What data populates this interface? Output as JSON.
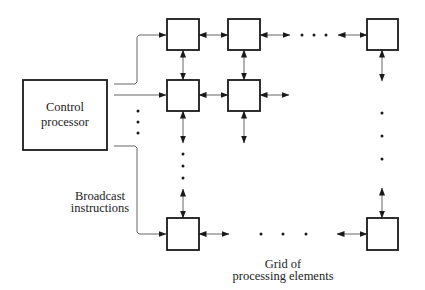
{
  "diagram": {
    "control_processor": {
      "label_line1": "Control",
      "label_line2": "processor",
      "rect": [
        23,
        80,
        84,
        70
      ]
    },
    "broadcast_label": {
      "line1": "Broadcast",
      "line2": "instructions"
    },
    "grid_label": {
      "line1": "Grid of",
      "line2": "processing elements"
    },
    "colors": {
      "stroke": "#1a1a1a",
      "wire": "#555555",
      "text": "#222222",
      "background": "#ffffff"
    },
    "processing_elements": [
      {
        "id": "pe-1-1",
        "x": 167,
        "y": 19,
        "w": 32,
        "h": 31
      },
      {
        "id": "pe-1-2",
        "x": 228,
        "y": 19,
        "w": 32,
        "h": 31
      },
      {
        "id": "pe-1-n",
        "x": 367,
        "y": 19,
        "w": 31,
        "h": 31
      },
      {
        "id": "pe-2-1",
        "x": 167,
        "y": 80,
        "w": 32,
        "h": 31
      },
      {
        "id": "pe-2-2",
        "x": 228,
        "y": 80,
        "w": 32,
        "h": 31
      },
      {
        "id": "pe-m-1",
        "x": 167,
        "y": 218,
        "w": 32,
        "h": 32
      },
      {
        "id": "pe-m-n",
        "x": 367,
        "y": 218,
        "w": 31,
        "h": 32
      }
    ],
    "broadcast_wires": [
      {
        "id": "wire-row1",
        "points": [
          [
            114,
            84
          ],
          [
            135,
            84
          ],
          [
            137,
            82
          ],
          [
            137,
            37
          ],
          [
            139,
            35
          ],
          [
            166,
            35
          ]
        ]
      },
      {
        "id": "wire-row2",
        "points": [
          [
            114,
            95
          ],
          [
            166,
            95
          ]
        ]
      },
      {
        "id": "wire-rowm",
        "points": [
          [
            114,
            146
          ],
          [
            135,
            146
          ],
          [
            137,
            148
          ],
          [
            137,
            232
          ],
          [
            139,
            234
          ],
          [
            166,
            234
          ]
        ]
      }
    ],
    "links": [
      {
        "id": "link-h-1-1-1-2",
        "x1": 199,
        "y1": 35,
        "x2": 228,
        "y2": 35,
        "start": true,
        "end": true
      },
      {
        "id": "link-h-1-2-out",
        "x1": 260,
        "y1": 35,
        "x2": 290,
        "y2": 35,
        "start": true,
        "end": true
      },
      {
        "id": "link-h-1-n-in",
        "x1": 338,
        "y1": 35,
        "x2": 367,
        "y2": 35,
        "start": true,
        "end": true
      },
      {
        "id": "link-h-2-1-2-2",
        "x1": 199,
        "y1": 95,
        "x2": 228,
        "y2": 95,
        "start": true,
        "end": true
      },
      {
        "id": "link-h-2-2-out",
        "x1": 260,
        "y1": 95,
        "x2": 289,
        "y2": 95,
        "start": true,
        "end": true
      },
      {
        "id": "link-h-m-1-out",
        "x1": 199,
        "y1": 234,
        "x2": 229,
        "y2": 234,
        "start": true,
        "end": true
      },
      {
        "id": "link-h-m-n-in",
        "x1": 337,
        "y1": 234,
        "x2": 367,
        "y2": 234,
        "start": true,
        "end": true
      },
      {
        "id": "link-v-1-1-2-1",
        "x1": 183,
        "y1": 50,
        "x2": 183,
        "y2": 80,
        "start": true,
        "end": true
      },
      {
        "id": "link-v-1-2-2-2",
        "x1": 244,
        "y1": 50,
        "x2": 244,
        "y2": 80,
        "start": true,
        "end": true
      },
      {
        "id": "link-v-2-1-down",
        "x1": 183,
        "y1": 111,
        "x2": 183,
        "y2": 143,
        "start": true,
        "end": true
      },
      {
        "id": "link-v-2-2-down",
        "x1": 244,
        "y1": 111,
        "x2": 244,
        "y2": 143,
        "start": true,
        "end": true
      },
      {
        "id": "link-v-1-n-down",
        "x1": 382,
        "y1": 50,
        "x2": 382,
        "y2": 81,
        "start": true,
        "end": true
      },
      {
        "id": "link-v-m-1-up",
        "x1": 183,
        "y1": 189,
        "x2": 183,
        "y2": 218,
        "start": true,
        "end": true
      },
      {
        "id": "link-v-m-n-up",
        "x1": 382,
        "y1": 188,
        "x2": 382,
        "y2": 218,
        "start": true,
        "end": true
      }
    ],
    "ellipses": [
      {
        "id": "dots-row1",
        "points": [
          [
            302,
            35
          ],
          [
            314,
            35
          ],
          [
            326,
            35
          ]
        ]
      },
      {
        "id": "dots-rowm",
        "points": [
          [
            261,
            234
          ],
          [
            283,
            234
          ],
          [
            306,
            234
          ]
        ]
      },
      {
        "id": "dots-col1",
        "points": [
          [
            183,
            154
          ],
          [
            183,
            166
          ],
          [
            183,
            178
          ]
        ]
      },
      {
        "id": "dots-coln",
        "points": [
          [
            382,
            113
          ],
          [
            382,
            136
          ],
          [
            382,
            159
          ]
        ]
      },
      {
        "id": "dots-broadcast",
        "points": [
          [
            138,
            111
          ],
          [
            138,
            122
          ],
          [
            138,
            133
          ]
        ]
      }
    ]
  }
}
